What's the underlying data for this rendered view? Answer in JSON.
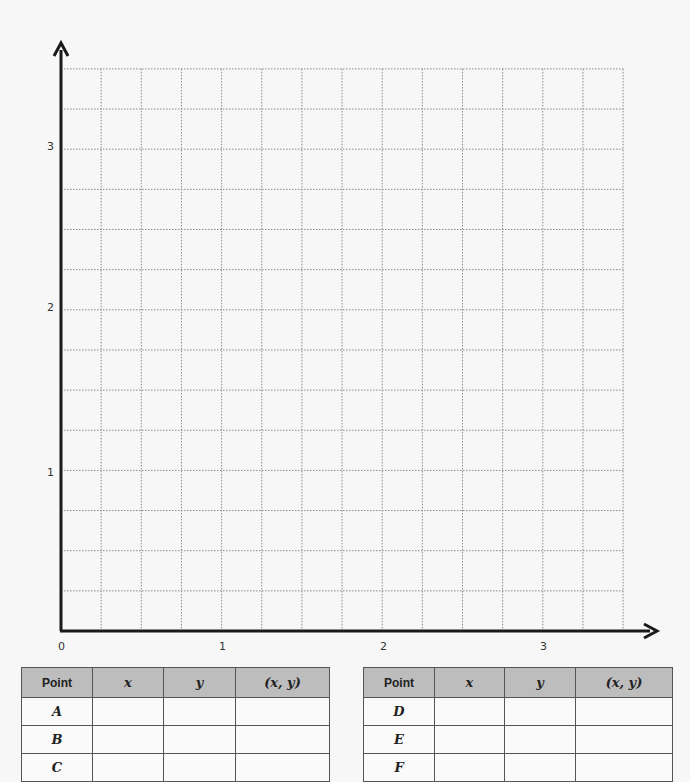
{
  "chart_data": {
    "type": "scatter",
    "title": "",
    "xlabel": "",
    "ylabel": "",
    "xlim": [
      0,
      3.5
    ],
    "ylim": [
      0,
      3.5
    ],
    "grid": true,
    "grid_step": 0.25,
    "x_ticks": [
      "0",
      "1",
      "2",
      "3"
    ],
    "y_ticks": [
      "1",
      "2",
      "3"
    ],
    "points": [],
    "legend": null
  },
  "axis_labels": {
    "origin": "0",
    "x1": "1",
    "x2": "2",
    "x3": "3",
    "y1": "1",
    "y2": "2",
    "y3": "3"
  },
  "tables": [
    {
      "headers": [
        "Point",
        "x",
        "y",
        "(x, y)"
      ],
      "rows": [
        {
          "point": "A",
          "x": "",
          "y": "",
          "xy": ""
        },
        {
          "point": "B",
          "x": "",
          "y": "",
          "xy": ""
        },
        {
          "point": "C",
          "x": "",
          "y": "",
          "xy": ""
        }
      ]
    },
    {
      "headers": [
        "Point",
        "x",
        "y",
        "(x, y)"
      ],
      "rows": [
        {
          "point": "D",
          "x": "",
          "y": "",
          "xy": ""
        },
        {
          "point": "E",
          "x": "",
          "y": "",
          "xy": ""
        },
        {
          "point": "F",
          "x": "",
          "y": "",
          "xy": ""
        }
      ]
    }
  ],
  "colors": {
    "axis": "#1a1a1a",
    "grid": "#8a8a8a",
    "header_bg": "#bdbdbd"
  }
}
